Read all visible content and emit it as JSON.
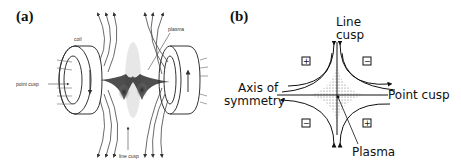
{
  "figure": {
    "panel_a": {
      "label": "(a)",
      "annotations": {
        "coil": "coil",
        "plasma": "plasma",
        "point_cusp": "point cusp",
        "line_cusp": "line cusp"
      }
    },
    "panel_b": {
      "label": "(b)",
      "annotations": {
        "line_cusp_1": "Line",
        "line_cusp_2": "cusp",
        "axis_1": "Axis of",
        "axis_2": "symmetry",
        "point_cusp": "Point  cusp",
        "plasma": "Plasma"
      },
      "polarity_boxes": {
        "top_left": "+",
        "top_right": "−",
        "bottom_left": "−",
        "bottom_right": "+"
      }
    }
  }
}
